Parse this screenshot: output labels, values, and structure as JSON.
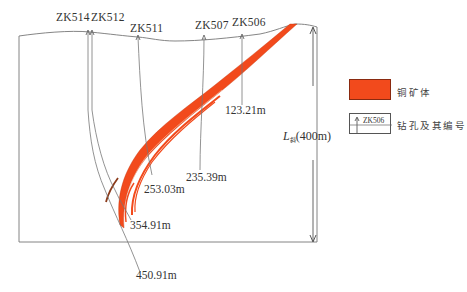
{
  "diagram": {
    "type": "geological cross-section",
    "boreholes": [
      {
        "id": "ZK514",
        "label": "ZK514",
        "depth": "450.91m"
      },
      {
        "id": "ZK512",
        "label": "ZK512",
        "depth": "354.91m"
      },
      {
        "id": "ZK511",
        "label": "ZK511",
        "depth": "253.03m"
      },
      {
        "id": "ZK507",
        "label": "ZK507",
        "depth": "235.39m"
      },
      {
        "id": "ZK506",
        "label": "ZK506",
        "depth": "123.21m"
      }
    ],
    "dimension": {
      "symbol": "L",
      "subscript": "斜",
      "value": "(400m)"
    },
    "legend": {
      "ore_label": "铜矿体",
      "ore_color": "#f24a1c",
      "hole_sample": "ZK506",
      "hole_label": "钻孔及其编号"
    },
    "colors": {
      "orebody": "#f24a1c",
      "orebody_dark": "#8b3a1a",
      "lines": "#666666"
    }
  }
}
